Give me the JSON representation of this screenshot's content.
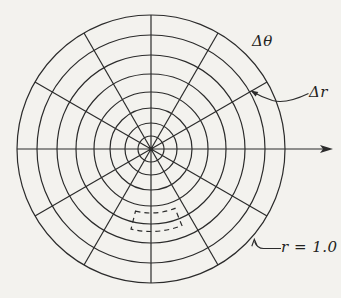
{
  "page": {
    "width": 341,
    "height": 298,
    "background": "#f3f2ee"
  },
  "diagram": {
    "stroke_color": "#2b2b2b",
    "stroke_width": 1.2,
    "center": {
      "x": 151,
      "y": 149
    },
    "circles": {
      "count": 8,
      "radii": [
        13,
        26,
        41,
        57,
        75,
        94,
        114,
        134
      ]
    },
    "spokes": {
      "count": 12,
      "step_deg": 30,
      "diameter_angles_deg": [
        30,
        60,
        90,
        120,
        150
      ]
    },
    "axis": {
      "y": 149,
      "x_start": 17,
      "x_end": 324,
      "arrowhead_points": "333,149 320,145 323,149 320,153"
    },
    "dashed_cell": {
      "r_inner": 64,
      "r_outer": 82.5,
      "start_deg": 256,
      "end_deg": 292,
      "dash_array": "5 4"
    },
    "labels": {
      "delta_theta": {
        "text": "Δθ",
        "left": 252,
        "top": 34
      },
      "delta_r": {
        "text": "Δr",
        "left": 309,
        "top": 85
      },
      "r_boundary": {
        "text": "r = 1.0",
        "left": 281,
        "top": 240
      }
    },
    "leaders": {
      "delta_r": {
        "path": "M 308.5 93.5 C 296 99.5 283 103.5 272.5 100.5 C 264.5 98 258 95 252 91.5",
        "arrowhead_points": "250.5,90.5 258.3,92.1 255.6,96.6"
      },
      "r_boundary": {
        "path": "M 281 248.5 L 263.5 248.5 C 258.5 248.5 256 245.5 254.6 241.5",
        "arrowhead_points": "251.8,246.3 254.3,239.3 256.9,245.2"
      }
    },
    "center_dot_radius": 2.3
  }
}
